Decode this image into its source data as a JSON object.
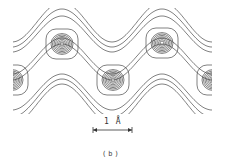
{
  "figure": {
    "caption": "(b)",
    "scale_bar": {
      "label": "1 Å",
      "x1": 93,
      "x2": 132,
      "y": 130
    },
    "stroke_color": "#4a4a4a",
    "background": "#ffffff",
    "plot_region": {
      "x": 13,
      "y": 10,
      "width": 199,
      "height": 102
    },
    "wave": {
      "description": "sinusoidal ridge contour bands alternating peaks",
      "period_px": 100,
      "band_offsets_upper": [
        -24,
        -18,
        -12
      ],
      "band_offsets_lower": [
        24,
        18,
        12,
        30
      ]
    },
    "peaks": [
      {
        "name": "top-left",
        "cx": 62,
        "cy": 44,
        "rings": 7
      },
      {
        "name": "top-right",
        "cx": 162,
        "cy": 43,
        "rings": 7
      },
      {
        "name": "bottom-center",
        "cx": 113,
        "cy": 80,
        "rings": 7
      },
      {
        "name": "bottom-left-partial",
        "cx": 12,
        "cy": 80,
        "rings": 7
      },
      {
        "name": "bottom-right-partial",
        "cx": 213,
        "cy": 80,
        "rings": 7
      }
    ]
  }
}
